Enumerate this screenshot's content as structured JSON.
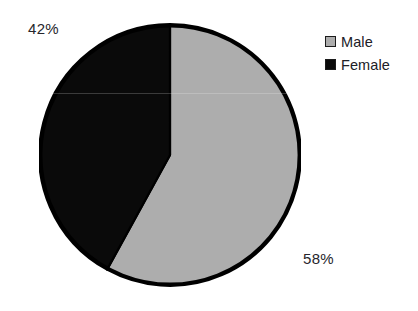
{
  "chart_data": {
    "type": "pie",
    "title": "",
    "title_note": "title cropped off at top edge of image, illegible",
    "categories": [
      "Male",
      "Female"
    ],
    "values": [
      58,
      42
    ],
    "value_unit": "%",
    "data_labels": [
      "58%",
      "42%"
    ],
    "colors": [
      "#ADADAD",
      "#0A0A0A"
    ],
    "start_angle_deg": 0,
    "direction": "clockwise",
    "legend_position": "right",
    "grid": false,
    "slices": [
      {
        "name": "Male",
        "value": 58,
        "label": "58%",
        "color": "#ADADAD",
        "legend_swatch_fill": "#ADADAD",
        "legend_swatch_border": "#1B1B1B"
      },
      {
        "name": "Female",
        "value": 42,
        "label": "42%",
        "color": "#0A0A0A",
        "legend_swatch_fill": "#0A0A0A",
        "legend_swatch_border": "#1B1B1B"
      }
    ]
  },
  "figure": {
    "background": "#FFFFFF",
    "outline_color": "#000000",
    "label_color": "#26262C"
  },
  "legend": {
    "items": [
      {
        "label": "Male"
      },
      {
        "label": "Female"
      }
    ]
  },
  "labels": {
    "female_pct": "42%",
    "male_pct": "58%"
  }
}
